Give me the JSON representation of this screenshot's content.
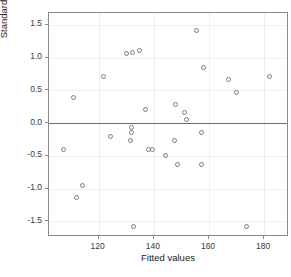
{
  "chart_data": {
    "type": "scatter",
    "title": "",
    "xlabel": "Fitted values",
    "ylabel": "Standardized residuals",
    "xlim": [
      102,
      189
    ],
    "ylim": [
      -1.74,
      1.68
    ],
    "xticks": [
      120,
      140,
      160,
      180
    ],
    "xtick_labels": [
      "120",
      "140",
      "160",
      "180"
    ],
    "yticks": [
      -1.5,
      -1.0,
      -0.5,
      0.0,
      0.5,
      1.0,
      1.5
    ],
    "ytick_labels": [
      "-1.5",
      "-1.0",
      "-0.5",
      "0.0",
      "0.5",
      "1.0",
      "1.5"
    ],
    "grid": true,
    "legend": "none",
    "reference_line": {
      "axis": "y",
      "value": 0.0,
      "color": "#6b6b6b"
    },
    "marker": {
      "shape": "open-circle",
      "color": "#7b7b8a",
      "size": 5
    },
    "points": [
      {
        "x": 107.4,
        "y": -0.41
      },
      {
        "x": 110.9,
        "y": 0.39
      },
      {
        "x": 112.0,
        "y": -1.14
      },
      {
        "x": 114.3,
        "y": -0.96
      },
      {
        "x": 121.7,
        "y": 0.71
      },
      {
        "x": 124.4,
        "y": -0.2
      },
      {
        "x": 130.1,
        "y": 1.06
      },
      {
        "x": 132.2,
        "y": 1.08
      },
      {
        "x": 132.6,
        "y": -1.58
      },
      {
        "x": 131.8,
        "y": -0.07
      },
      {
        "x": 131.8,
        "y": -0.14
      },
      {
        "x": 131.4,
        "y": -0.27
      },
      {
        "x": 134.9,
        "y": 1.11
      },
      {
        "x": 136.8,
        "y": 0.2
      },
      {
        "x": 137.9,
        "y": -0.4
      },
      {
        "x": 139.4,
        "y": -0.41
      },
      {
        "x": 144.2,
        "y": -0.49
      },
      {
        "x": 147.8,
        "y": 0.28
      },
      {
        "x": 147.6,
        "y": -0.26
      },
      {
        "x": 148.4,
        "y": -0.63
      },
      {
        "x": 151.0,
        "y": 0.16
      },
      {
        "x": 152.0,
        "y": 0.06
      },
      {
        "x": 155.6,
        "y": 1.41
      },
      {
        "x": 157.4,
        "y": -0.15
      },
      {
        "x": 157.3,
        "y": -0.64
      },
      {
        "x": 158.0,
        "y": 0.85
      },
      {
        "x": 166.9,
        "y": 0.66
      },
      {
        "x": 169.9,
        "y": 0.47
      },
      {
        "x": 173.5,
        "y": -1.58
      },
      {
        "x": 182.1,
        "y": 0.71
      }
    ]
  }
}
